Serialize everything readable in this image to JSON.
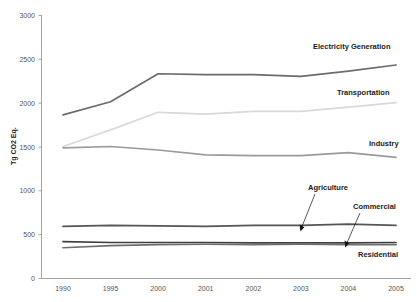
{
  "chart_data": {
    "type": "line",
    "title": "",
    "xlabel": "",
    "ylabel": "Tg CO2 Eq.",
    "categories": [
      "1990",
      "1995",
      "2000",
      "2001",
      "2002",
      "2003",
      "2004",
      "2005"
    ],
    "x": [
      1990,
      1995,
      2000,
      2001,
      2002,
      2003,
      2004,
      2005
    ],
    "ylim": [
      0,
      3000
    ],
    "yticks": [
      0,
      500,
      1000,
      1500,
      2000,
      2500,
      3000
    ],
    "grid": false,
    "legend_position": "inline-labels-right",
    "series": [
      {
        "name": "Electricity Generation",
        "color": "#6b6b6b",
        "values": [
          1860,
          2010,
          2330,
          2320,
          2320,
          2300,
          2360,
          2430
        ]
      },
      {
        "name": "Transportation",
        "color": "#d9d9d9",
        "values": [
          1500,
          1690,
          1890,
          1870,
          1900,
          1900,
          1950,
          2000
        ]
      },
      {
        "name": "Industry",
        "color": "#9a9a9a",
        "values": [
          1485,
          1500,
          1460,
          1405,
          1395,
          1395,
          1430,
          1375
        ]
      },
      {
        "name": "Agriculture",
        "color": "#555555",
        "values": [
          590,
          600,
          595,
          590,
          600,
          600,
          615,
          600
        ]
      },
      {
        "name": "Commercial",
        "color": "#3f3f3f",
        "values": [
          415,
          405,
          405,
          405,
          400,
          400,
          400,
          405
        ]
      },
      {
        "name": "Residential",
        "color": "#6f6f6f",
        "values": [
          345,
          370,
          380,
          385,
          380,
          385,
          380,
          380
        ]
      }
    ],
    "annotations": [
      {
        "name": "Agriculture",
        "target_series": "Agriculture",
        "target_x": 2003
      },
      {
        "name": "Commercial",
        "target_series": "Commercial",
        "target_x": 2004
      }
    ]
  },
  "axis": {
    "y_tick_labels": [
      "0",
      "500",
      "1000",
      "1500",
      "2000",
      "2500",
      "3000"
    ],
    "x_tick_labels": [
      "1990",
      "1995",
      "2000",
      "2001",
      "2002",
      "2003",
      "2004",
      "2005"
    ],
    "y_title": "Tg CO2 Eq."
  },
  "labels": {
    "electricity_generation": "Electricity Generation",
    "transportation": "Transportation",
    "industry": "Industry",
    "agriculture": "Agriculture",
    "commercial": "Commercial",
    "residential": "Residential"
  }
}
